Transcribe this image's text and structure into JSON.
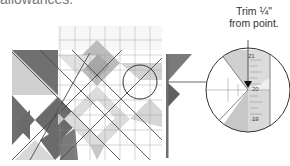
{
  "cropped_heading": "allowances.",
  "callout": {
    "line1": "Trim ¼\"",
    "line2": "from point."
  },
  "ruler_labels": {
    "top": "21",
    "middle": "20",
    "bottom": "19"
  },
  "colors": {
    "dark_gray": "#6b6b6b",
    "mid_gray": "#a9a9a9",
    "light_gray": "#d6d6d6",
    "ruler_line": "#8a8a8a",
    "outline": "#333333"
  }
}
